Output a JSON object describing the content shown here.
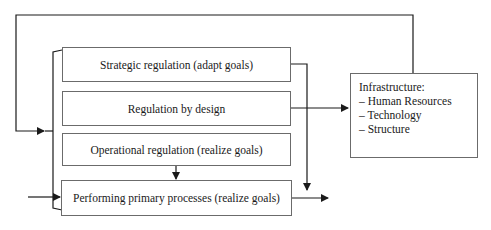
{
  "diagram": {
    "boxes": {
      "strategic": "Strategic regulation (adapt goals)",
      "design": "Regulation by design",
      "operational": "Operational regulation (realize goals)",
      "primary": "Performing primary processes (realize goals)"
    },
    "infrastructure": {
      "title": "Infrastructure:",
      "items": [
        "– Human Resources",
        "– Technology",
        "– Structure"
      ]
    },
    "colors": {
      "line": "#1a1a1a",
      "border": "#6b6b6b",
      "background": "#ffffff"
    }
  }
}
